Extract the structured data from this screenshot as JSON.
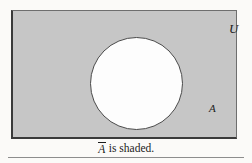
{
  "figure": {
    "type": "venn-diagram",
    "universe": {
      "label": "U",
      "name": "universal-set",
      "fill_color": "#c6c6c6",
      "shaded": true
    },
    "sets": [
      {
        "label": "A",
        "name": "set-a",
        "fill_color": "#fdfdfd",
        "shaded": false
      }
    ],
    "caption": {
      "complement_symbol": "A",
      "text": " is shaded."
    },
    "colors": {
      "shading": "#c6c6c6",
      "outline": "#3a3a3a",
      "background": "#fbfaf8",
      "rule": "#8d8d8d"
    }
  }
}
